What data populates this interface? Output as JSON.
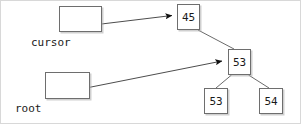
{
  "diagram": {
    "background_color": "#ffffff",
    "border_color": "#d8d8d8",
    "line_color": "#4d4d4d",
    "node_border_color": "#6e6e6e",
    "text_color": "#1a1a1a",
    "variables": [
      {
        "id": "cursor",
        "label": "cursor",
        "box": {
          "x": 58,
          "y": 5,
          "w": 43,
          "h": 26
        },
        "label_pos": {
          "x": 30,
          "y": 36
        },
        "points_to": "node-45"
      },
      {
        "id": "root",
        "label": "root",
        "box": {
          "x": 44,
          "y": 71,
          "w": 45,
          "h": 27
        },
        "label_pos": {
          "x": 14,
          "y": 102
        },
        "points_to": "node-53-root"
      }
    ],
    "nodes": [
      {
        "id": "node-45",
        "value": "45",
        "box": {
          "x": 176,
          "y": 3,
          "w": 23,
          "h": 26
        }
      },
      {
        "id": "node-53-root",
        "value": "53",
        "box": {
          "x": 227,
          "y": 48,
          "w": 23,
          "h": 26
        }
      },
      {
        "id": "node-53-left",
        "value": "53",
        "box": {
          "x": 203,
          "y": 87,
          "w": 24,
          "h": 26
        }
      },
      {
        "id": "node-54-right",
        "value": "54",
        "box": {
          "x": 258,
          "y": 87,
          "w": 24,
          "h": 26
        }
      }
    ],
    "edges": [
      {
        "id": "edge-45-to-53root",
        "from": "node-45",
        "to": "node-53-root",
        "x1": 197,
        "y1": 29,
        "x2": 233,
        "y2": 48,
        "arrow": false
      },
      {
        "id": "edge-53root-to-53left",
        "from": "node-53-root",
        "to": "node-53-left",
        "x1": 230,
        "y1": 74,
        "x2": 215,
        "y2": 87,
        "arrow": false
      },
      {
        "id": "edge-53root-to-54right",
        "from": "node-53-root",
        "to": "node-54-right",
        "x1": 248,
        "y1": 74,
        "x2": 268,
        "y2": 87,
        "arrow": false
      }
    ],
    "pointer_arrows": [
      {
        "id": "arrow-cursor",
        "from": "cursor",
        "to": "node-45",
        "x1": 88,
        "y1": 24,
        "x2": 176,
        "y2": 14,
        "arrow": true
      },
      {
        "id": "arrow-root",
        "from": "root",
        "to": "node-53-root",
        "x1": 70,
        "y1": 90,
        "x2": 227,
        "y2": 59,
        "arrow": true
      }
    ]
  }
}
